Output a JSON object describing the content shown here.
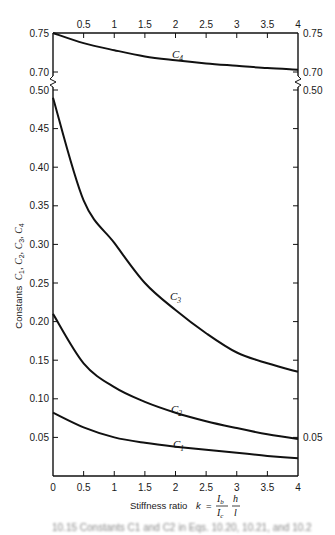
{
  "chart_data": {
    "type": "line",
    "title": "",
    "xlabel": "Stiffness ratio k = (I_b / I_c)(h / l)",
    "xlabel_parts": {
      "prefix": "Stiffness ratio",
      "k": "k",
      "eq": "=",
      "num1": "I",
      "num1_sub": "b",
      "den1": "I",
      "den1_sub": "c",
      "num2": "h",
      "den2": "l"
    },
    "ylabel": "Constants C1, C2, C3, C4",
    "ylabel_parts": {
      "prefix": "Constants",
      "vars": [
        "C",
        "1",
        "C",
        "2",
        "C",
        "3",
        "C",
        "4"
      ]
    },
    "xlim": [
      0,
      4
    ],
    "ylim_lower": [
      0,
      0.5
    ],
    "ylim_upper": [
      0.7,
      0.75
    ],
    "axis_break": "between 0.50 and 0.70",
    "grid": false,
    "legend": "none (curves labeled inline)",
    "x_ticks_bottom": [
      "0",
      "0.5",
      "1",
      "1.5",
      "2",
      "2.5",
      "3",
      "3.5",
      "4"
    ],
    "x_ticks_top": [
      "0.5",
      "1",
      "1.5",
      "2",
      "2.5",
      "3",
      "3.5",
      "4"
    ],
    "y_ticks_left": [
      "0.75",
      "0.70",
      "0.50",
      "0.45",
      "0.40",
      "0.35",
      "0.30",
      "0.25",
      "0.20",
      "0.15",
      "0.10",
      "0.05"
    ],
    "y_ticks_right": [
      "0.75",
      "0.70",
      "0.50",
      "0.05"
    ],
    "x": [
      0,
      0.5,
      1,
      1.5,
      2,
      2.5,
      3,
      3.5,
      4
    ],
    "series": [
      {
        "name": "C4",
        "label": "C",
        "sub": "4",
        "values": [
          0.75,
          0.737,
          0.728,
          0.72,
          0.715,
          0.711,
          0.708,
          0.705,
          0.703
        ]
      },
      {
        "name": "C3",
        "label": "C",
        "sub": "3",
        "values": [
          0.49,
          0.357,
          0.302,
          0.25,
          0.215,
          0.185,
          0.16,
          0.146,
          0.135
        ]
      },
      {
        "name": "C2",
        "label": "C",
        "sub": "2",
        "values": [
          0.21,
          0.146,
          0.115,
          0.096,
          0.082,
          0.071,
          0.062,
          0.054,
          0.048
        ]
      },
      {
        "name": "C1",
        "label": "C",
        "sub": "1",
        "values": [
          0.082,
          0.063,
          0.05,
          0.043,
          0.038,
          0.034,
          0.03,
          0.026,
          0.023
        ]
      }
    ]
  },
  "caption": "10.15   Constants C1 and C2 in Eqs. 10.20, 10.21, and 10.2"
}
